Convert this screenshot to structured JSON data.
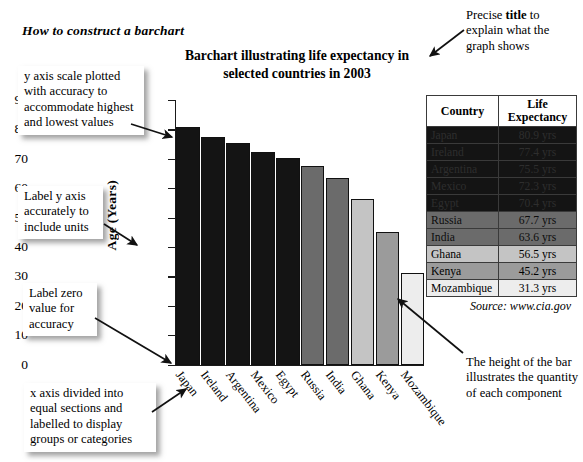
{
  "headline": "How to construct a barchart",
  "chart_data": {
    "type": "bar",
    "title": "Barchart illustrating life expectancy in selected countries in 2003",
    "xlabel": "",
    "ylabel": "Age (Years)",
    "ylim": [
      0,
      90
    ],
    "ytick_step": 10,
    "yticks": [
      "90",
      "80",
      "70",
      "60",
      "50",
      "40",
      "30",
      "20",
      "10",
      "0"
    ],
    "grid": false,
    "legend": "none",
    "source": "Source: www.cia.gov",
    "categories": [
      "Japan",
      "Ireland",
      "Argentina",
      "Mexico",
      "Egypt",
      "Russia",
      "India",
      "Ghana",
      "Kenya",
      "Mozambique"
    ],
    "values": [
      80.9,
      77.4,
      75.5,
      72.3,
      70.4,
      67.7,
      63.6,
      56.5,
      45.2,
      31.3
    ],
    "value_labels": [
      "80.9 yrs",
      "77.4 yrs",
      "75.5 yrs",
      "72.3 yrs",
      "70.4 yrs",
      "67.7 yrs",
      "63.6 yrs",
      "56.5 yrs",
      "45.2 yrs",
      "31.3 yrs"
    ],
    "bar_colors": [
      "#141414",
      "#141414",
      "#141414",
      "#141414",
      "#141414",
      "#6b6b6b",
      "#6b6b6b",
      "#c4c4c4",
      "#9b9b9b",
      "#ededed"
    ]
  },
  "table": {
    "headers": [
      "Country",
      "Life Expectancy"
    ],
    "header_country": "Country",
    "header_value_line1": "Life",
    "header_value_line2": "Expectancy",
    "rows": [
      {
        "country": "Japan",
        "value": "80.9 yrs",
        "shade": "#141414",
        "text": "#2e2e2e"
      },
      {
        "country": "Ireland",
        "value": "77.4 yrs",
        "shade": "#141414",
        "text": "#2e2e2e"
      },
      {
        "country": "Argentina",
        "value": "75.5 yrs",
        "shade": "#141414",
        "text": "#2e2e2e"
      },
      {
        "country": "Mexico",
        "value": "72.3 yrs",
        "shade": "#141414",
        "text": "#2e2e2e"
      },
      {
        "country": "Egypt",
        "value": "70.4 yrs",
        "shade": "#141414",
        "text": "#2e2e2e"
      },
      {
        "country": "Russia",
        "value": "67.7 yrs",
        "shade": "#6b6b6b",
        "text": "#0d0d0d"
      },
      {
        "country": "India",
        "value": "63.6 yrs",
        "shade": "#6b6b6b",
        "text": "#0d0d0d"
      },
      {
        "country": "Ghana",
        "value": "56.5 yrs",
        "shade": "#c4c4c4",
        "text": "#000000"
      },
      {
        "country": "Kenya",
        "value": "45.2 yrs",
        "shade": "#9b9b9b",
        "text": "#000000"
      },
      {
        "country": "Mozambique",
        "value": "31.3 yrs",
        "shade": "#ededed",
        "text": "#000000"
      }
    ]
  },
  "annotations": {
    "y_scale": "y axis scale plotted with accuracy to accommodate highest and lowest values",
    "y_label": "Label y axis accurately to include units",
    "zero_value": "Label zero value for accuracy",
    "x_axis": "x axis divided into equal sections and labelled to display groups or categories",
    "title_note_pre": "Precise ",
    "title_note_bold": "title",
    "title_note_post": " to explain what the graph shows",
    "bar_height": "The height of the bar illustrates the quantity of each component"
  }
}
